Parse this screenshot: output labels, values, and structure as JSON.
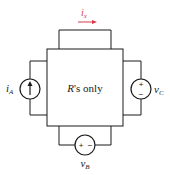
{
  "diagram": {
    "type": "circuit",
    "network_label": "R's only",
    "network_label_italic_part": "R",
    "network_label_rest": "'s only",
    "current_label": {
      "main": "i",
      "sub": "x",
      "color": "#d93a4a",
      "direction": "right"
    },
    "sources": [
      {
        "id": "left",
        "kind": "current-source",
        "label_main": "i",
        "label_sub": "A",
        "arrow": "up"
      },
      {
        "id": "right",
        "kind": "voltage-source",
        "label_main": "v",
        "label_sub": "C",
        "plus": "+",
        "minus": "−",
        "orientation": "plus-top"
      },
      {
        "id": "bottom",
        "kind": "voltage-source",
        "label_main": "v",
        "label_sub": "B",
        "plus": "+",
        "minus": "−",
        "orientation": "plus-left"
      }
    ]
  }
}
